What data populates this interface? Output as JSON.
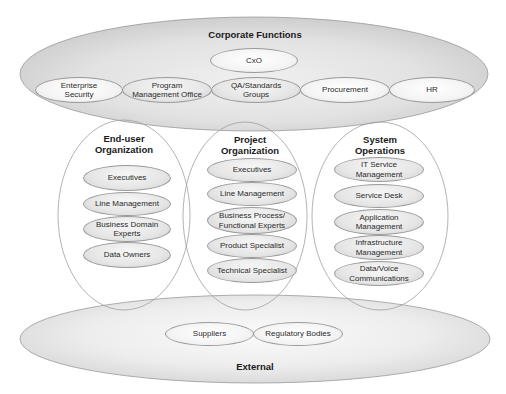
{
  "corporate": {
    "title": "Corporate Functions",
    "top": "CxO",
    "row": [
      "Enterprise\nSecurity",
      "Program\nManagement Office",
      "QA/Standards\nGroups",
      "Procurement",
      "HR"
    ]
  },
  "enduser": {
    "title": "End-user\nOrganization",
    "items": [
      "Executives",
      "Line Management",
      "Business Domain\nExperts",
      "Data Owners"
    ]
  },
  "project": {
    "title": "Project\nOrganization",
    "items": [
      "Executives",
      "Line Management",
      "Business Process/\nFunctional Experts",
      "Product Specialist",
      "Technical Specialist"
    ]
  },
  "system": {
    "title": "System\nOperations",
    "items": [
      "IT Service\nManagement",
      "Service Desk",
      "Application\nManagement",
      "Infrastructure\nManagement",
      "Data/Voice\nCommunications"
    ]
  },
  "external": {
    "title": "External",
    "items": [
      "Suppliers",
      "Regulatory Bodies"
    ]
  },
  "colors": {
    "outline": "#9a9a9a",
    "fill_dark": "#cfcfcf",
    "fill_light": "#f4f4f4",
    "text": "#222222"
  }
}
